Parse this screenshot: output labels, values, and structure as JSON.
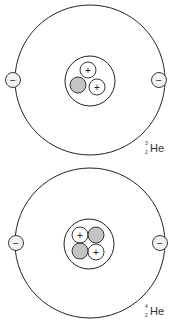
{
  "diagram": {
    "colors": {
      "stroke": "#222222",
      "neutron_fill": "#c4c4c4",
      "proton_fill": "#ffffff",
      "electron_fill": "#f2f2f2",
      "background": "#ffffff"
    },
    "atoms": [
      {
        "id": "helium-3",
        "label": {
          "symbol": "He",
          "mass_number": "3",
          "atomic_number": "2"
        },
        "electrons": [
          {
            "sign": "−"
          },
          {
            "sign": "−"
          }
        ],
        "nucleus": {
          "protons": [
            {
              "sign": "+"
            },
            {
              "sign": "+"
            }
          ],
          "neutrons": 1
        }
      },
      {
        "id": "helium-4",
        "label": {
          "symbol": "He",
          "mass_number": "4",
          "atomic_number": "2"
        },
        "electrons": [
          {
            "sign": "−"
          },
          {
            "sign": "−"
          }
        ],
        "nucleus": {
          "protons": [
            {
              "sign": "+"
            },
            {
              "sign": "+"
            }
          ],
          "neutrons": 2
        }
      }
    ]
  }
}
